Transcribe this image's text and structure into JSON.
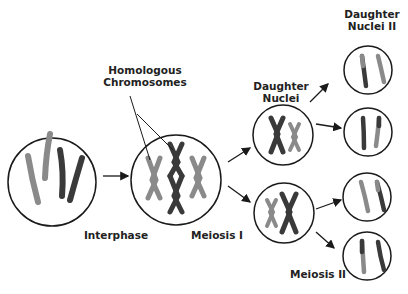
{
  "labels": {
    "homologous": [
      "Homologous",
      "Chromosomes"
    ],
    "daughter_nuclei": [
      "Daughter",
      "Nuclei"
    ],
    "daughter_nuclei_ii": [
      "Daughter",
      "Nuclei II"
    ],
    "interphase": "Interphase",
    "meiosis_i": "Meiosis I",
    "meiosis_ii": "Meiosis II"
  },
  "colors": {
    "dark": "#3a3a3a",
    "light": "#8a8a8a",
    "outline": "#1a1a1a"
  }
}
